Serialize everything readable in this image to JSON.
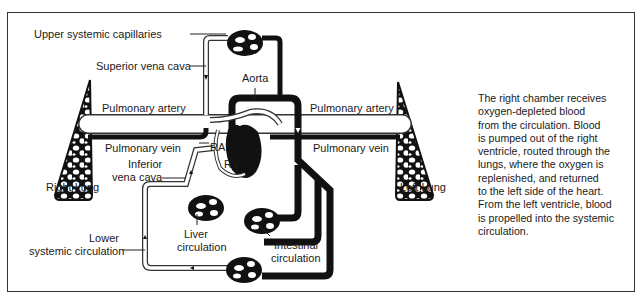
{
  "diagram": {
    "labels": {
      "upper_systemic_capillaries": "Upper systemic capillaries",
      "superior_vena_cava": "Superior vena cava",
      "aorta": "Aorta",
      "pulmonary_artery_left": "Pulmonary artery",
      "pulmonary_artery_right": "Pulmonary artery",
      "pulmonary_vein_left": "Pulmonary vein",
      "pulmonary_vein_right": "Pulmonary vein",
      "ra": "RA",
      "rv": "RV",
      "inferior_vena_cava_line1": "Inferior",
      "inferior_vena_cava_line2": "vena cava",
      "right_lung": "Right Lung",
      "left_lung": "Left Lung",
      "liver_line1": "Liver",
      "liver_line2": "circulation",
      "intestinal_line1": "Intestinal",
      "intestinal_line2": "circulation",
      "lower_line1": "Lower",
      "lower_line2": "systemic circulation"
    },
    "description": "The right chamber receives\noxygen-depleted blood\nfrom the circulation. Blood\nis pumped out of the right\nventricle, routed through the\nlungs, where the oxygen is\nreplenished, and returned\nto the left side of the heart.\nFrom the left ventricle, blood\nis propelled into the systemic\ncirculation.",
    "colors": {
      "oxygenated_vessel": "#111111",
      "deoxygenated_vessel_outline": "#333333",
      "background": "#ffffff"
    }
  }
}
